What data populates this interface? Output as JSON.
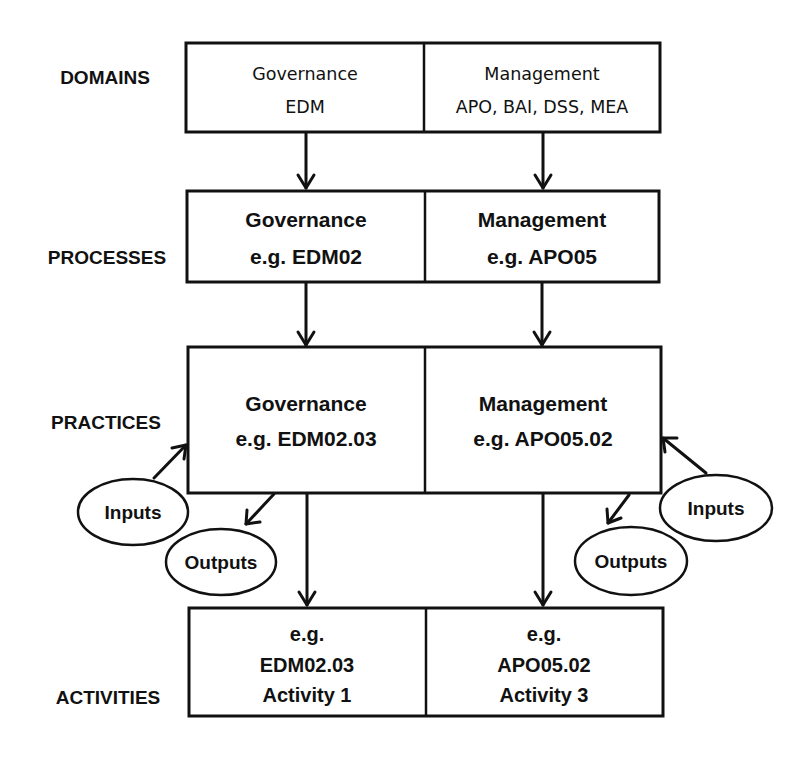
{
  "row_labels": {
    "domains": "DOMAINS",
    "processes": "PROCESSES",
    "practices": "PRACTICES",
    "activities": "ACTIVITIES"
  },
  "domains": {
    "governance": {
      "line1": "Governance",
      "line2": "EDM"
    },
    "management": {
      "line1": "Management",
      "line2": "APO, BAI, DSS, MEA"
    }
  },
  "processes": {
    "governance": {
      "line1": "Governance",
      "line2": "e.g. EDM02"
    },
    "management": {
      "line1": "Management",
      "line2": "e.g. APO05"
    }
  },
  "practices": {
    "governance": {
      "line1": "Governance",
      "line2": "e.g. EDM02.03"
    },
    "management": {
      "line1": "Management",
      "line2": "e.g. APO05.02"
    },
    "left_inputs": "Inputs",
    "left_outputs": "Outputs",
    "right_inputs": "Inputs",
    "right_outputs": "Outputs"
  },
  "activities": {
    "governance": {
      "line1": "e.g.",
      "line2": "EDM02.03",
      "line3": "Activity 1"
    },
    "management": {
      "line1": "e.g.",
      "line2": "APO05.02",
      "line3": "Activity 3"
    }
  }
}
